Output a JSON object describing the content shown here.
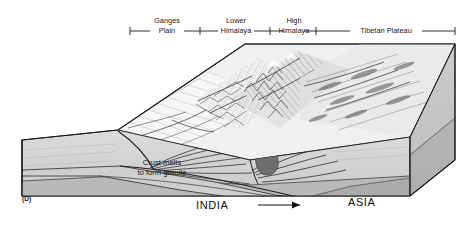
{
  "figure": {
    "panel_tag": "(D)",
    "type": "block-diagram"
  },
  "scale_bar": {
    "segments": [
      {
        "label_line1": "Ganges",
        "label_line2": "Plain",
        "x_start": 130,
        "x_end": 200
      },
      {
        "label_line1": "Lower",
        "label_line2": "Himalaya",
        "x_start": 200,
        "x_end": 270
      },
      {
        "label_line1": "High",
        "label_line2": "Himalaya",
        "x_start": 270,
        "x_end": 316
      },
      {
        "label_line1": "Tibetan Plateau",
        "label_line2": "",
        "x_start": 316,
        "x_end": 455
      }
    ],
    "y_rule": 31,
    "tick_half_height": 4
  },
  "plate_labels": {
    "left": "INDIA",
    "right": "ASIA"
  },
  "annotations": {
    "granite": {
      "line1": "Crust melts",
      "line2": "to form granite"
    }
  },
  "motion_arrow": {
    "name": "india-convergence-arrow",
    "direction": "right"
  },
  "colors": {
    "upper_crust": "#d3d3d3",
    "lower_crust": "#b9b9b9",
    "mantle_wedge": "#a8a8a8",
    "side_face_top": "#c6c6c6",
    "side_face_bottom": "#b0b0b0",
    "granite_body": "#6e6e6e",
    "terrain_base": "#efefef",
    "outline": "#1a1a1a",
    "fault_line": "#3a3a3a",
    "text": "#111111"
  }
}
